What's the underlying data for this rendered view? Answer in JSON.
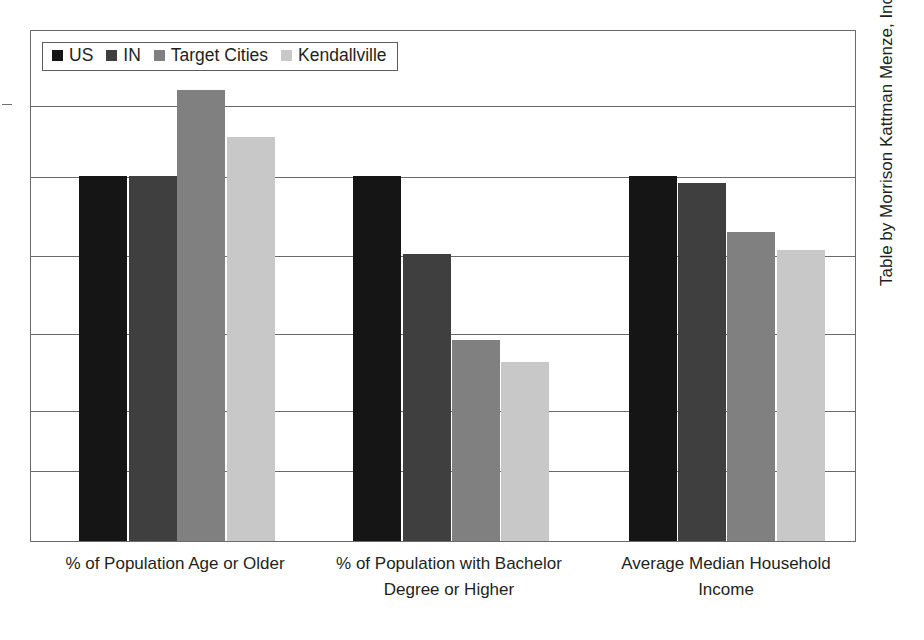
{
  "chart_data": {
    "type": "bar",
    "title": "",
    "subtitle": "",
    "xlabel": "",
    "ylabel": "",
    "grid": true,
    "legend_position": "top-left inside plot area",
    "axis_tick_labels": "none",
    "gridline_count": 6,
    "categories": [
      "% of Population Age or Older",
      "% of Population with Bachelor Degree or Higher",
      "Average Median Household Income"
    ],
    "category_lines": [
      [
        "% of Population Age or Older"
      ],
      [
        "% of Population with Bachelor",
        "Degree or Higher"
      ],
      [
        "Average Median Household",
        "Income"
      ]
    ],
    "series": [
      {
        "name": "US",
        "color": "#151515",
        "values": [
          100.0,
          100.0,
          100.0
        ],
        "bar_top_px": [
          176,
          176,
          176
        ]
      },
      {
        "name": "IN",
        "color": "#3f3f3f",
        "values": [
          100.0,
          78.6,
          98.1
        ],
        "bar_top_px": [
          176,
          254,
          183
        ]
      },
      {
        "name": "Target Cities",
        "color": "#808080",
        "values": [
          123.6,
          55.1,
          84.7
        ],
        "bar_top_px": [
          90,
          340,
          232
        ]
      },
      {
        "name": "Kendallville",
        "color": "#c8c8c8",
        "values": [
          110.7,
          49.0,
          79.7
        ],
        "bar_top_px": [
          137,
          362,
          250
        ]
      }
    ],
    "ylim": [
      0,
      140
    ],
    "baseline_px": 541,
    "plot_top_px": 30
  },
  "legend": {
    "items": [
      {
        "label": "US",
        "color": "#151515"
      },
      {
        "label": "IN",
        "color": "#3f3f3f"
      },
      {
        "label": "Target Cities",
        "color": "#808080"
      },
      {
        "label": "Kendallville",
        "color": "#c8c8c8"
      }
    ]
  },
  "source_credit": "Table by Morrison Kattman Menze, Inc. (2010)"
}
